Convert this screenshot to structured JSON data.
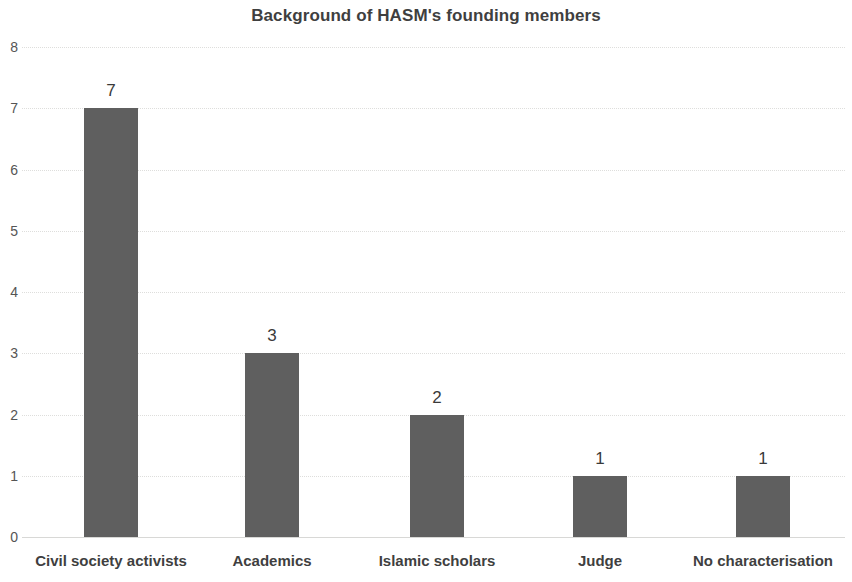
{
  "chart_data": {
    "type": "bar",
    "title": "Background of HASM's founding members",
    "xlabel": "",
    "ylabel": "",
    "categories": [
      "Civil society activists",
      "Academics",
      "Islamic scholars",
      "Judge",
      "No characterisation"
    ],
    "values": [
      7,
      3,
      2,
      1,
      1
    ],
    "data_labels": [
      "7",
      "3",
      "2",
      "1",
      "1"
    ],
    "ylim": [
      0,
      8
    ],
    "ytick_labels": [
      "0",
      "1",
      "2",
      "3",
      "4",
      "5",
      "6",
      "7",
      "8"
    ],
    "ytick_values": [
      0,
      1,
      2,
      3,
      4,
      5,
      6,
      7,
      8
    ],
    "grid": true,
    "grid_axis": "y",
    "legend": false,
    "legend_position": "none",
    "bar_color": "#5f5f5f",
    "gridline_color": "#dededc",
    "title_color": "#3f3f3f",
    "label_color": "#3f3f3f",
    "tick_color": "#555555"
  }
}
